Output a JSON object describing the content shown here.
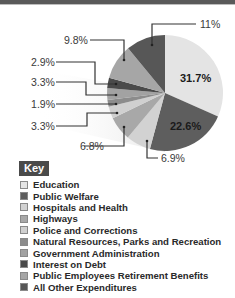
{
  "chart_data": {
    "type": "pie",
    "title": "",
    "start_angle_deg": 0,
    "direction": "clockwise",
    "slices": [
      {
        "label": "Education",
        "value": 31.7,
        "display": "31.7%",
        "color": "#e4e4e4"
      },
      {
        "label": "Public Welfare",
        "value": 22.6,
        "display": "22.6%",
        "color": "#5e5e5e"
      },
      {
        "label": "Hospitals and Health",
        "value": 6.9,
        "display": "6.9%",
        "color": "#d2d2d2"
      },
      {
        "label": "Highways",
        "value": 6.8,
        "display": "6.8%",
        "color": "#a8a8a8"
      },
      {
        "label": "Police and Corrections",
        "value": 3.3,
        "display": "3.3%",
        "color": "#d0d0d0"
      },
      {
        "label": "Natural Resources, Parks and Recreation",
        "value": 1.9,
        "display": "1.9%",
        "color": "#8c8c8c"
      },
      {
        "label": "Government Administration",
        "value": 3.3,
        "display": "3.3%",
        "color": "#a2a2a2"
      },
      {
        "label": "Interest on Debt",
        "value": 2.9,
        "display": "2.9%",
        "color": "#4a4a4a"
      },
      {
        "label": "Public Employees Retirement Benefits",
        "value": 9.8,
        "display": "9.8%",
        "color": "#a6a6a6"
      },
      {
        "label": "All Other Expenditures",
        "value": 11,
        "display": "11%",
        "color": "#575757"
      }
    ],
    "legend_title": "Key",
    "legend_position": "bottom-left"
  },
  "key": {
    "title": "Key",
    "items": [
      {
        "label": "Education",
        "color": "#e4e4e4"
      },
      {
        "label": "Public Welfare",
        "color": "#5e5e5e"
      },
      {
        "label": "Hospitals and Health",
        "color": "#d2d2d2"
      },
      {
        "label": "Highways",
        "color": "#a8a8a8"
      },
      {
        "label": "Police and Corrections",
        "color": "#d0d0d0"
      },
      {
        "label": "Natural Resources, Parks and Recreation",
        "color": "#8c8c8c"
      },
      {
        "label": "Government Administration",
        "color": "#a2a2a2"
      },
      {
        "label": "Interest on Debt",
        "color": "#4a4a4a"
      },
      {
        "label": "Public Employees Retirement Benefits",
        "color": "#a6a6a6"
      },
      {
        "label": "All Other Expenditures",
        "color": "#575757"
      }
    ]
  },
  "labels": {
    "education": "31.7%",
    "public_welfare": "22.6%",
    "hospitals": "6.9%",
    "highways": "6.8%",
    "police": "3.3%",
    "natural_resources": "1.9%",
    "gov_admin": "3.3%",
    "interest": "2.9%",
    "retirement": "9.8%",
    "other": "11%"
  }
}
